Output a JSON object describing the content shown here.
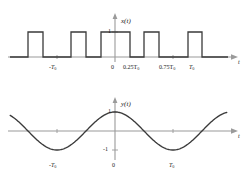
{
  "figure": {
    "title": "",
    "background": "#ffffff",
    "curve_color": "#3a3a3a",
    "axis_color": "#8c8c8c"
  },
  "chart_data": [
    {
      "type": "line",
      "name": "square-wave",
      "title": "x(t)",
      "xlabel": "t",
      "ylabel": "x(t)",
      "ylim": [
        0,
        1
      ],
      "xlim": [
        -1.35,
        1.45
      ],
      "grid": false,
      "legend": null,
      "description": "Periodic rectangular pulse train of amplitude 1, period T0, duty cycle 50%, pulses centered so that a pulse spans from -0.25T0 to 0.25T0.",
      "y_ticks": [
        {
          "value": 1,
          "label": "1"
        }
      ],
      "x_ticks": [
        {
          "value": -1.0,
          "label": "-T0"
        },
        {
          "value": 0.0,
          "label": "0"
        },
        {
          "value": 0.25,
          "label": "0.25T0"
        },
        {
          "value": 0.75,
          "label": "0.75T0"
        },
        {
          "value": 1.0,
          "label": "T0"
        }
      ],
      "x": [
        -1.35,
        -1.25,
        -1.25,
        -0.75,
        -0.75,
        -0.25,
        -0.25,
        0.25,
        0.25,
        0.75,
        0.75,
        1.25,
        1.25,
        1.45
      ],
      "values": [
        0,
        0,
        1,
        1,
        0,
        0,
        1,
        1,
        0,
        0,
        1,
        1,
        0,
        0
      ]
    },
    {
      "type": "line",
      "name": "cosine-wave",
      "title": "y(t)",
      "xlabel": "t",
      "ylabel": "y(t)",
      "ylim": [
        -1,
        1
      ],
      "xlim": [
        -1.35,
        1.45
      ],
      "grid": false,
      "legend": null,
      "description": "Cosine wave of amplitude 1 and period T0, peaks at t = -T0, 0, T0 and troughs at t = -0.5T0, 0.5T0.",
      "y_ticks": [
        {
          "value": 1,
          "label": "1"
        },
        {
          "value": -1,
          "label": "-1"
        }
      ],
      "x_ticks": [
        {
          "value": -1.0,
          "label": "-T0"
        },
        {
          "value": 0.0,
          "label": "0"
        },
        {
          "value": 1.0,
          "label": "T0"
        }
      ],
      "formula": "cos(2*pi*t/T0)"
    }
  ],
  "top_plot": {
    "signal_label": "x(t)",
    "amplitude_label": "1",
    "axis_label": "t",
    "tick_minus_t0": "-T",
    "tick_minus_t0_sub": "0",
    "tick_zero": "0",
    "tick_quarter": "0.25T",
    "tick_quarter_sub": "0",
    "tick_three_quarter": "0.75T",
    "tick_three_quarter_sub": "0",
    "tick_t0": "T",
    "tick_t0_sub": "0"
  },
  "bottom_plot": {
    "signal_label": "y(t)",
    "amplitude_label": "1",
    "amplitude_neg_label": "-1",
    "axis_label": "t",
    "tick_minus_t0": "-T",
    "tick_minus_t0_sub": "0",
    "tick_zero": "0",
    "tick_t0": "T",
    "tick_t0_sub": "0"
  }
}
